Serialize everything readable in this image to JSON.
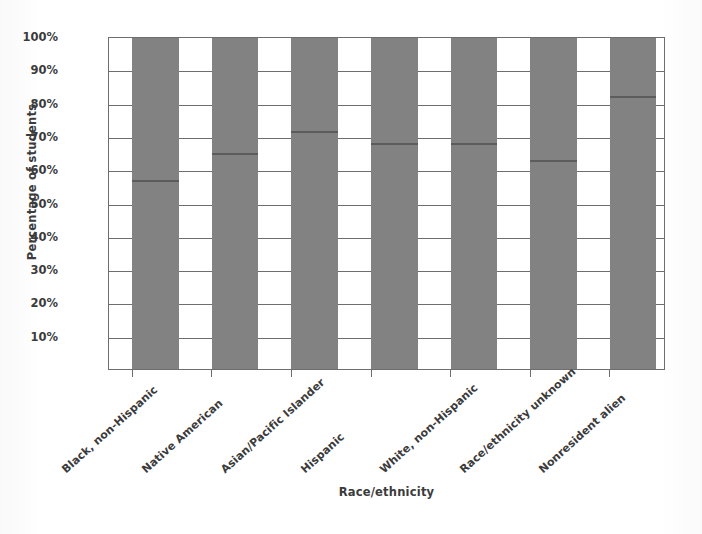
{
  "chart_data": {
    "type": "bar",
    "title": "",
    "xlabel": "Race/ethnicity",
    "ylabel": "Percentage of students",
    "categories": [
      "Black, non-Hispanic",
      "Native American",
      "Asian/Pacific Islander",
      "Hispanic",
      "White, non-Hispanic",
      "Race/ethnicity unknown",
      "Nonresident alien"
    ],
    "values": [
      57.5,
      65.5,
      72,
      68.5,
      68.5,
      63.5,
      82.5
    ],
    "value_labels": [
      "57.5%",
      "65.5%",
      "72%",
      "68.5%",
      "68.5%",
      "63.5%",
      "82.5%"
    ],
    "ylim": [
      0,
      100
    ],
    "ytick_values": [
      10,
      20,
      30,
      40,
      50,
      60,
      70,
      80,
      90,
      100
    ],
    "ytick_labels": [
      "10%",
      "20%",
      "30%",
      "40%",
      "50%",
      "60%",
      "70%",
      "80%",
      "90%",
      "100%"
    ],
    "gridlines": "horizontal",
    "legend": "none",
    "bar_color": "#828282",
    "value_line_color": "#5c5c5c",
    "axis_color": "#6e6e6e"
  }
}
